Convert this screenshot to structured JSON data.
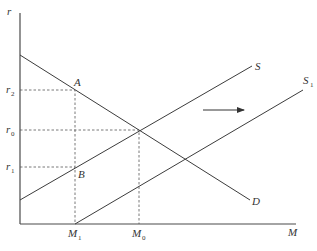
{
  "diagram": {
    "type": "supply-demand-money-market",
    "axes": {
      "y_label": "r",
      "x_label": "M"
    },
    "curves": [
      {
        "name": "D",
        "label": "D",
        "description": "downward-sloping demand curve"
      },
      {
        "name": "S",
        "label": "S",
        "description": "original upward-sloping supply curve"
      },
      {
        "name": "S1",
        "label": "S",
        "label_sub": "1",
        "description": "supply curve shifted right"
      }
    ],
    "points": {
      "A": {
        "label": "A"
      },
      "B": {
        "label": "B"
      }
    },
    "y_ticks": [
      {
        "label": "r",
        "sub": "2"
      },
      {
        "label": "r",
        "sub": "0"
      },
      {
        "label": "r",
        "sub": "1"
      }
    ],
    "x_ticks": [
      {
        "label": "M",
        "sub": "1"
      },
      {
        "label": "M",
        "sub": "0"
      }
    ],
    "shift_arrow": {
      "direction": "right"
    },
    "colors": {
      "line": "#3c3c3c",
      "background": "#ffffff"
    }
  }
}
